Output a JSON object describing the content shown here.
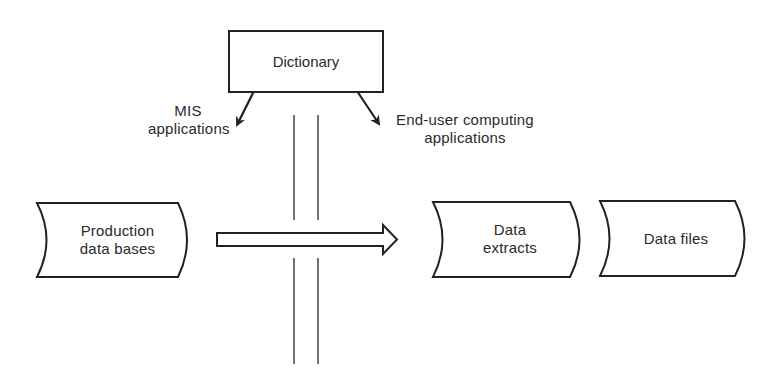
{
  "diagram": {
    "top_node": {
      "label": "Dictionary"
    },
    "branch_labels": {
      "left": [
        "MIS",
        "applications"
      ],
      "right": [
        "End-user computing",
        "applications"
      ]
    },
    "source": {
      "label": [
        "Production",
        "data bases"
      ]
    },
    "targets": [
      {
        "label": [
          "Data",
          "extracts"
        ]
      },
      {
        "label": [
          "Data files"
        ]
      }
    ],
    "colors": {
      "stroke": "#222222",
      "background": "#ffffff"
    }
  }
}
